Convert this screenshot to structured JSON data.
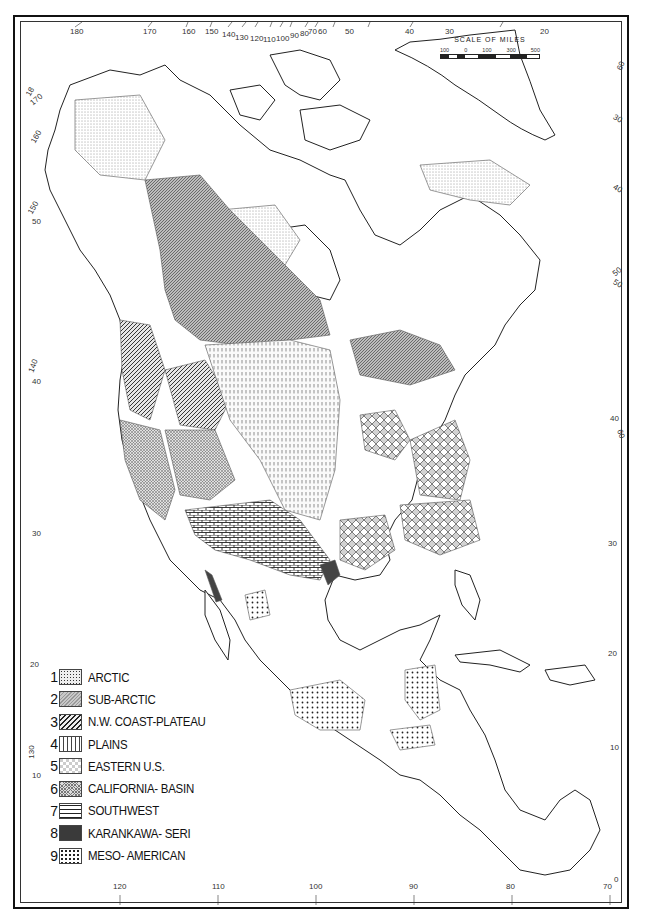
{
  "map": {
    "subject": "North America culture areas",
    "scale": {
      "title": "SCALE OF MILES",
      "ticks": [
        "100",
        "0",
        "100",
        "300",
        "500"
      ]
    },
    "top_longitudes": [
      "180",
      "170",
      "160",
      "150",
      "140",
      "130",
      "120",
      "110",
      "100",
      "90",
      "80",
      "70",
      "60",
      "50",
      "40",
      "30",
      "20"
    ],
    "bottom_longitudes": [
      "120",
      "110",
      "100",
      "90",
      "80",
      "70"
    ],
    "bottom_corner_label": "0",
    "left_labels": [
      "18",
      "170",
      "160",
      "150",
      "50",
      "140",
      "40",
      "30",
      "20",
      "130",
      "10"
    ],
    "right_labels": [
      "60",
      "30",
      "40",
      "50",
      "50",
      "40",
      "60",
      "30",
      "20",
      "10"
    ],
    "legend": [
      {
        "num": "1",
        "label": "ARCTIC",
        "pattern": "fine-dots"
      },
      {
        "num": "2",
        "label": "SUB-ARCTIC",
        "pattern": "dense-wavy-gray"
      },
      {
        "num": "3",
        "label": "N.W. COAST-PLATEAU",
        "pattern": "diagonal-lines"
      },
      {
        "num": "4",
        "label": "PLAINS",
        "pattern": "vertical-dashes"
      },
      {
        "num": "5",
        "label": "EASTERN U.S.",
        "pattern": "diamond-lattice"
      },
      {
        "num": "6",
        "label": "CALIFORNIA- BASIN",
        "pattern": "fine-crosshatch"
      },
      {
        "num": "7",
        "label": "SOUTHWEST",
        "pattern": "brick"
      },
      {
        "num": "8",
        "label": "KARANKAWA- SERI",
        "pattern": "solid-dark"
      },
      {
        "num": "9",
        "label": "MESO- AMERICAN",
        "pattern": "coarse-dots"
      }
    ]
  }
}
